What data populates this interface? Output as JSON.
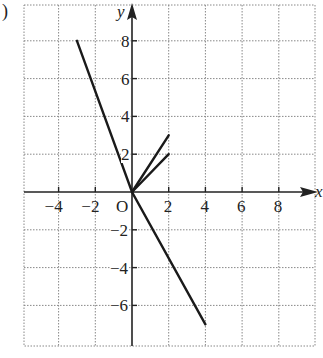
{
  "figure_label": ")",
  "chart_data": {
    "type": "line",
    "title": "",
    "xlabel": "x",
    "ylabel": "y",
    "origin_label": "O",
    "xlim": [
      -6,
      10
    ],
    "ylim": [
      -8,
      10
    ],
    "grid": true,
    "grid_step": 2,
    "x_ticks": [
      -4,
      -2,
      2,
      4,
      6,
      8
    ],
    "x_tick_labels": [
      "−4",
      "−2",
      "2",
      "4",
      "6",
      "8"
    ],
    "y_ticks": [
      8,
      6,
      4,
      2,
      -2,
      -4,
      -6
    ],
    "y_tick_labels": [
      "8",
      "6",
      "4",
      "2",
      "−2",
      "−4",
      "−6"
    ],
    "series": [
      {
        "name": "line-1",
        "points": [
          [
            -3,
            8
          ],
          [
            0,
            0
          ],
          [
            4,
            -7
          ]
        ]
      },
      {
        "name": "line-2",
        "points": [
          [
            0,
            0
          ],
          [
            2,
            3
          ]
        ]
      },
      {
        "name": "line-3",
        "points": [
          [
            0,
            0
          ],
          [
            2,
            2
          ]
        ]
      }
    ],
    "colors": {
      "line": "#1a1a1a",
      "grid": "#888888",
      "axis": "#222222"
    }
  }
}
